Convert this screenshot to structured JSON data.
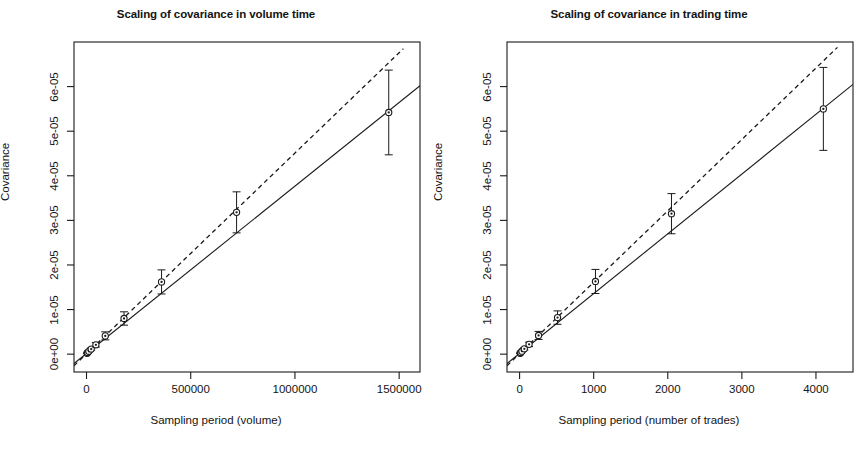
{
  "figure": {
    "background": "#ffffff",
    "foreground": "#1a1a1a",
    "panel_count": 2
  },
  "chart_data": [
    {
      "type": "scatter",
      "panel": "left",
      "title": "Scaling of covariance in volume time",
      "xlabel": "Sampling period (volume)",
      "ylabel": "Covariance",
      "xlim": [
        -60000,
        1600000
      ],
      "ylim": [
        -4e-06,
        7e-05
      ],
      "xticks": [
        0,
        500000,
        1000000,
        1500000
      ],
      "xticklabels": [
        "0",
        "500000",
        "1000000",
        "1500000"
      ],
      "yticks": [
        0,
        1e-05,
        2e-05,
        3e-05,
        4e-05,
        5e-05,
        6e-05
      ],
      "yticklabels": [
        "0e+00",
        "1e-05",
        "2e-05",
        "3e-05",
        "4e-05",
        "5e-05",
        "6e-05"
      ],
      "grid": false,
      "legend": null,
      "marker": "open-circle-with-dot",
      "error_bars": "vertical",
      "x": [
        2800,
        5600,
        11300,
        22500,
        45000,
        90000,
        180000,
        360000,
        720000,
        1450000
      ],
      "y": [
        2e-07,
        3.6e-07,
        6.4e-07,
        1.15e-06,
        2.1e-06,
        4.1e-06,
        8e-06,
        1.62e-05,
        3.18e-05,
        5.42e-05
      ],
      "yerr": [
        4e-08,
        7e-08,
        1.4e-07,
        2.6e-07,
        5e-07,
        9e-07,
        1.5e-06,
        2.7e-06,
        4.6e-06,
        9.5e-06
      ],
      "lines": [
        {
          "name": "fitted-scaling-line",
          "style": "solid",
          "x": [
            -60000,
            1600000
          ],
          "y": [
            -2.1e-06,
            6.02e-05
          ]
        },
        {
          "name": "reference-linear-line",
          "style": "dashed",
          "x": [
            -60000,
            1520000
          ],
          "y": [
            -2.6e-06,
            6.85e-05
          ]
        }
      ]
    },
    {
      "type": "scatter",
      "panel": "right",
      "title": "Scaling of covariance in trading time",
      "xlabel": "Sampling period (number of trades)",
      "ylabel": "Covariance",
      "xlim": [
        -170,
        4500
      ],
      "ylim": [
        -4e-06,
        7e-05
      ],
      "xticks": [
        0,
        1000,
        2000,
        3000,
        4000
      ],
      "xticklabels": [
        "0",
        "1000",
        "2000",
        "3000",
        "4000"
      ],
      "yticks": [
        0,
        1e-05,
        2e-05,
        3e-05,
        4e-05,
        5e-05,
        6e-05
      ],
      "yticklabels": [
        "0e+00",
        "1e-05",
        "2e-05",
        "3e-05",
        "4e-05",
        "5e-05",
        "6e-05"
      ],
      "grid": false,
      "legend": null,
      "marker": "open-circle-with-dot",
      "error_bars": "vertical",
      "x": [
        8,
        16,
        32,
        64,
        128,
        256,
        512,
        1024,
        2050,
        4100
      ],
      "y": [
        2e-07,
        3.6e-07,
        6.6e-07,
        1.2e-06,
        2.2e-06,
        4.2e-06,
        8.2e-06,
        1.63e-05,
        3.15e-05,
        5.5e-05
      ],
      "yerr": [
        4e-08,
        7e-08,
        1.4e-07,
        2.6e-07,
        5e-07,
        9e-07,
        1.5e-06,
        2.7e-06,
        4.5e-06,
        9.3e-06
      ],
      "lines": [
        {
          "name": "fitted-scaling-line",
          "style": "solid",
          "x": [
            -170,
            4500
          ],
          "y": [
            -2.1e-06,
            6.05e-05
          ]
        },
        {
          "name": "reference-linear-line",
          "style": "dashed",
          "x": [
            -170,
            4290
          ],
          "y": [
            -2.6e-06,
            6.88e-05
          ]
        }
      ]
    }
  ]
}
